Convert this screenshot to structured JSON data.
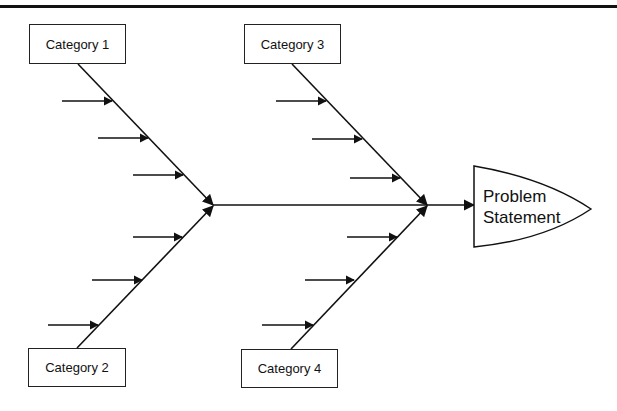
{
  "diagram": {
    "type": "fishbone",
    "problem": {
      "line1": "Problem",
      "line2": "Statement"
    },
    "categories": [
      {
        "label": "Category 1",
        "position": "top-left",
        "causes": 3
      },
      {
        "label": "Category 2",
        "position": "bottom-left",
        "causes": 3
      },
      {
        "label": "Category 3",
        "position": "top-right",
        "causes": 3
      },
      {
        "label": "Category 4",
        "position": "bottom-right",
        "causes": 3
      }
    ],
    "colors": {
      "line": "#111111",
      "background": "#ffffff"
    }
  }
}
